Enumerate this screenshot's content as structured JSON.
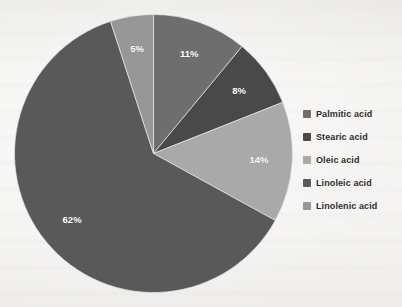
{
  "chart_data": {
    "type": "pie",
    "title": "",
    "subtitle": "",
    "xlabel": "",
    "ylabel": "",
    "grid": false,
    "legend_position": "right",
    "start_angle_deg": 0,
    "direction": "clockwise",
    "categories": [
      "Palmitic acid",
      "Stearic acid",
      "Oleic acid",
      "Linoleic acid",
      "Linolenic acid"
    ],
    "values": [
      11,
      8,
      14,
      62,
      5
    ],
    "value_unit": "%",
    "data_labels": [
      "11%",
      "8%",
      "14%",
      "62%",
      "5%"
    ],
    "colors": [
      "#6e6e6e",
      "#494949",
      "#a9a9a9",
      "#595959",
      "#979797"
    ],
    "slices": [
      {
        "label": "Palmitic acid",
        "value": 11,
        "data_label": "11%",
        "color": "#6e6e6e"
      },
      {
        "label": "Stearic acid",
        "value": 8,
        "data_label": "8%",
        "color": "#494949"
      },
      {
        "label": "Oleic acid",
        "value": 14,
        "data_label": "14%",
        "color": "#a9a9a9"
      },
      {
        "label": "Linoleic acid",
        "value": 62,
        "data_label": "62%",
        "color": "#595959"
      },
      {
        "label": "Linolenic acid",
        "value": 5,
        "data_label": "5%",
        "color": "#979797"
      }
    ]
  },
  "legend": {
    "items": [
      {
        "label": "Palmitic acid",
        "color": "#6e6e6e"
      },
      {
        "label": "Stearic acid",
        "color": "#494949"
      },
      {
        "label": "Oleic acid",
        "color": "#a9a9a9"
      },
      {
        "label": "Linoleic acid",
        "color": "#595959"
      },
      {
        "label": "Linolenic acid",
        "color": "#979797"
      }
    ]
  },
  "canvas": {
    "background_color": "#f3f2f0",
    "plot_center_x": 153,
    "plot_center_y": 153,
    "plot_radius": 139
  }
}
